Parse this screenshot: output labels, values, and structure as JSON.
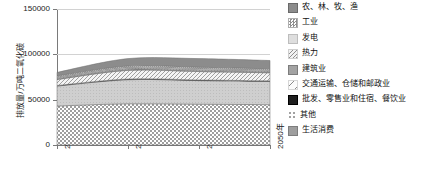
{
  "chart_data": {
    "type": "area",
    "title": "",
    "xlabel": "",
    "ylabel": "排放量/万吨二氧化碳",
    "ylim": [
      0,
      150000
    ],
    "yticks": [
      0,
      50000,
      100000,
      150000
    ],
    "ytick_labels": [
      "0",
      "50000",
      "100000",
      "150000"
    ],
    "grid": true,
    "legend_position": "right",
    "x": [
      2018,
      2030,
      2040,
      2050
    ],
    "xtick_labels": [
      "2018年",
      "2030年",
      "2040年",
      "2050年"
    ],
    "stack_order_bottom_to_top": [
      "生活消费",
      "其他",
      "批发、零售业和住宿、餐饮业",
      "交通运输、仓储和邮政业",
      "建筑业",
      "热力",
      "发电",
      "工业",
      "农、林、牧、渔"
    ],
    "series": [
      {
        "name": "农、林、牧、渔",
        "pattern": "solid-dark-gray",
        "color": "#8c8c8c",
        "values": [
          3800,
          8200,
          9500,
          9200
        ]
      },
      {
        "name": "工业",
        "pattern": "checker-fine",
        "color": "#c9c9c9",
        "values": [
          1200,
          1400,
          1400,
          1300
        ]
      },
      {
        "name": "发电",
        "pattern": "solid-light-gray",
        "color": "#d9d9d9",
        "values": [
          1100,
          1300,
          1300,
          1200
        ]
      },
      {
        "name": "热力",
        "pattern": "diagonal-hatch-light",
        "color": "#e0e0e0",
        "values": [
          900,
          1100,
          1100,
          1000
        ]
      },
      {
        "name": "建筑业",
        "pattern": "solid-mid-gray",
        "color": "#a8a8a8",
        "values": [
          900,
          1000,
          1000,
          900
        ]
      },
      {
        "name": "交通运输、仓储和邮政业",
        "pattern": "diagonal-hatch-sparse",
        "color": "#ededed",
        "values": [
          6500,
          9500,
          9200,
          8800
        ]
      },
      {
        "name": "批发、零售业和住宿、餐饮业",
        "pattern": "solid-black",
        "color": "#1a1a1a",
        "values": [
          700,
          800,
          800,
          800
        ]
      },
      {
        "name": "其他",
        "pattern": "dotted-sparse",
        "color": "#c0c0c0",
        "values": [
          22000,
          26500,
          26000,
          25500
        ]
      },
      {
        "name": "生活消费",
        "pattern": "checkerboard",
        "color": "#b5b5b5",
        "values": [
          43000,
          45500,
          45000,
          44500
        ]
      }
    ],
    "totals": [
      80100,
      95300,
      95300,
      93200
    ]
  },
  "legend": {
    "items": [
      {
        "label": "农、林、牧、渔",
        "swatch": "solid-dark-gray"
      },
      {
        "label": "工业",
        "swatch": "checker-fine"
      },
      {
        "label": "发电",
        "swatch": "solid-light-gray"
      },
      {
        "label": "热力",
        "swatch": "diagonal-hatch-light"
      },
      {
        "label": "建筑业",
        "swatch": "solid-mid-gray"
      },
      {
        "label": "交通运输、仓储和邮政业",
        "swatch": "diagonal-hatch-sparse"
      },
      {
        "label": "批发、零售业和住宿、餐饮业",
        "swatch": "solid-black"
      },
      {
        "label": "其他",
        "swatch": "dotted-sparse"
      },
      {
        "label": "生活消费",
        "swatch": "solid-mid-gray-2"
      }
    ]
  }
}
